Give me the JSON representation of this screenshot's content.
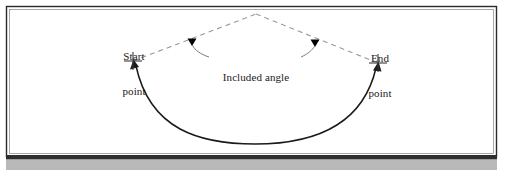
{
  "figure": {
    "type": "technical-drawing",
    "width": 506,
    "height": 170,
    "background_color": "#ffffff"
  },
  "frame": {
    "border_color": "#2b2b2b",
    "fill_color": "#ffffff",
    "x": 6,
    "y": 6,
    "width": 491,
    "height": 151
  },
  "footer": {
    "bar_color": "#2e2e2e",
    "strip_color": "#b9b9b9",
    "bar_y": 155,
    "bar_height": 4,
    "strip_y": 159,
    "strip_height": 11
  },
  "labels": {
    "start_point": {
      "line1": "Start",
      "line2": "point"
    },
    "end_point": {
      "line1": "End",
      "line2": "point"
    },
    "included_angle": {
      "text": "Included angle"
    }
  },
  "geometry": {
    "start_point": {
      "x": 133,
      "y": 61
    },
    "end_point": {
      "x": 378,
      "y": 63
    },
    "apex": {
      "x": 256,
      "y": 14
    },
    "arc_lowest": {
      "x": 255,
      "y": 144
    },
    "arrowhead_left": {
      "x": 192,
      "y": 42
    },
    "arrowhead_right": {
      "x": 315,
      "y": 43
    }
  },
  "styles": {
    "dashed_line_color": "#9a9a9a",
    "dashed_pattern": "5,4",
    "dashed_width": 1.1,
    "arc_color": "#1a1a1a",
    "arc_width": 1.5,
    "leader_color": "#5a5a5a",
    "leader_width": 0.8,
    "crosshair_color": "#3a3a3a",
    "arrowhead_color": "#000000",
    "text_color": "#1a1a1a"
  }
}
